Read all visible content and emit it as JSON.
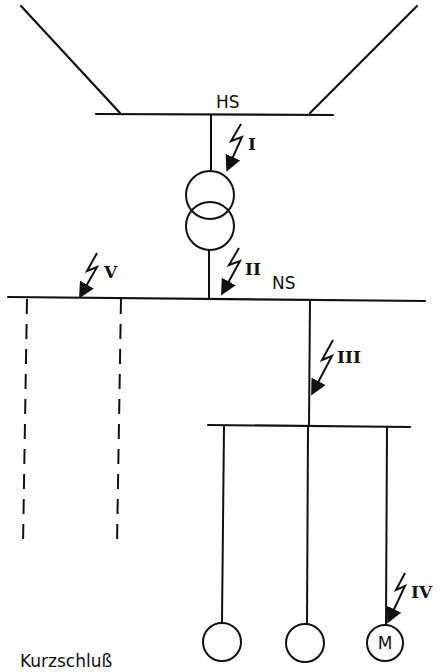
{
  "diagram": {
    "title": "Kurzschluß",
    "busbars": {
      "hv": {
        "label": "HS"
      },
      "lv": {
        "label": "NS"
      },
      "sub": {
        "label": ""
      }
    },
    "fault_points": [
      {
        "id": "I",
        "label": "I",
        "location": "HS side of transformer"
      },
      {
        "id": "II",
        "label": "II",
        "location": "NS side of transformer"
      },
      {
        "id": "III",
        "label": "III",
        "location": "feeder to sub-distribution"
      },
      {
        "id": "IV",
        "label": "IV",
        "location": "motor feeder"
      },
      {
        "id": "V",
        "label": "V",
        "location": "NS busbar"
      }
    ],
    "loads": [
      {
        "label": ""
      },
      {
        "label": ""
      },
      {
        "label": "M"
      }
    ],
    "colors": {
      "line": "#111111",
      "background": "#ffffff"
    }
  }
}
